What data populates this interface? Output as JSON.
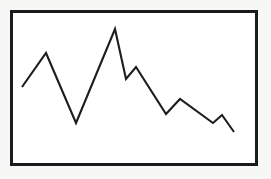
{
  "figure": {
    "name": "line-chart",
    "background_color": "#f7f7f6",
    "plot_background_color": "#ffffff",
    "border_color": "#1b1b1b",
    "line_color": "#1d1d1d",
    "title": "",
    "caption": ""
  },
  "chart_data": {
    "type": "line",
    "title": "",
    "subtitle": "",
    "xlabel": "",
    "ylabel": "",
    "grid": false,
    "legend": false,
    "legend_position": "none",
    "axis_ticks": false,
    "tick_labels": [],
    "annotations": [],
    "xlim": [
      0,
      10
    ],
    "ylim": [
      0,
      10
    ],
    "series": [
      {
        "name": "series-1",
        "color": "#1d1d1d",
        "x": [
          0,
          1,
          2,
          3,
          4,
          5,
          6,
          7,
          8,
          9,
          10
        ],
        "values": [
          4.0,
          6.4,
          1.5,
          8.1,
          4.5,
          5.3,
          2.0,
          3.0,
          1.4,
          2.0,
          0.8
        ],
        "points_px": [
          [
            22,
            87
          ],
          [
            46,
            53
          ],
          [
            76,
            123
          ],
          [
            115,
            29
          ],
          [
            126,
            79
          ],
          [
            136,
            67
          ],
          [
            166,
            114
          ],
          [
            180,
            99
          ],
          [
            213,
            123
          ],
          [
            222,
            115
          ],
          [
            234,
            132
          ]
        ]
      }
    ]
  }
}
